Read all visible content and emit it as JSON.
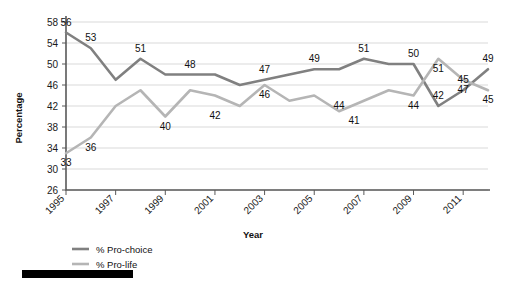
{
  "chart_data": {
    "type": "line",
    "title": "",
    "xlabel": "Year",
    "ylabel": "Percentage",
    "ylim": [
      26,
      58
    ],
    "ytick_step": 4,
    "yticks": [
      26,
      30,
      34,
      38,
      42,
      46,
      50,
      54,
      58
    ],
    "xlim": [
      1995,
      2012
    ],
    "xticks": [
      1995,
      1997,
      1999,
      2001,
      2003,
      2005,
      2007,
      2009,
      2011
    ],
    "xtick_labels": [
      "1995",
      "1997",
      "1999",
      "2001",
      "2003",
      "2005",
      "2007",
      "2009",
      "2011"
    ],
    "x": [
      1995,
      1996,
      1997,
      1998,
      1999,
      2000,
      2001,
      2002,
      2003,
      2004,
      2005,
      2006,
      2007,
      2008,
      2009,
      2010,
      2011,
      2012
    ],
    "grid": true,
    "legend_position": "bottom-left",
    "series": [
      {
        "name": "% Pro-choice",
        "color": "#808080",
        "values": [
          56,
          53,
          47,
          51,
          48,
          48,
          48,
          46,
          47,
          48,
          49,
          49,
          51,
          50,
          50,
          42,
          45,
          49
        ],
        "labels": [
          {
            "x": 1995,
            "y": 56,
            "text": "56"
          },
          {
            "x": 1996,
            "y": 53,
            "text": "53"
          },
          {
            "x": 1998,
            "y": 51,
            "text": "51"
          },
          {
            "x": 2000,
            "y": 48,
            "text": "48"
          },
          {
            "x": 2003,
            "y": 47,
            "text": "47"
          },
          {
            "x": 2005,
            "y": 49,
            "text": "49"
          },
          {
            "x": 2007,
            "y": 51,
            "text": "51"
          },
          {
            "x": 2009,
            "y": 50,
            "text": "50"
          },
          {
            "x": 2010,
            "y": 42,
            "text": "42"
          },
          {
            "x": 2011,
            "y": 45,
            "text": "45"
          },
          {
            "x": 2012,
            "y": 49,
            "text": "49"
          }
        ]
      },
      {
        "name": "% Pro-life",
        "color": "#b5b5b5",
        "values": [
          33,
          36,
          42,
          45,
          40,
          45,
          44,
          42,
          46,
          43,
          44,
          41,
          43,
          45,
          44,
          51,
          47,
          45
        ],
        "labels": [
          {
            "x": 1995,
            "y": 33,
            "text": "33"
          },
          {
            "x": 1996,
            "y": 36,
            "text": "36"
          },
          {
            "x": 1999,
            "y": 40,
            "text": "40"
          },
          {
            "x": 2001,
            "y": 42,
            "text": "42"
          },
          {
            "x": 2003,
            "y": 46,
            "text": "46"
          },
          {
            "x": 2006,
            "y": 44,
            "text": "44"
          },
          {
            "x": 2006.6,
            "y": 41,
            "text": "41"
          },
          {
            "x": 2009,
            "y": 44,
            "text": "44"
          },
          {
            "x": 2010,
            "y": 51,
            "text": "51"
          },
          {
            "x": 2011,
            "y": 47,
            "text": "47"
          },
          {
            "x": 2012,
            "y": 45,
            "text": "45"
          }
        ]
      }
    ]
  },
  "legend": {
    "items": [
      {
        "label": "% Pro-choice",
        "color": "#808080"
      },
      {
        "label": "% Pro-life",
        "color": "#b5b5b5"
      }
    ]
  },
  "axis": {
    "y_title": "Percentage",
    "x_title": "Year"
  }
}
